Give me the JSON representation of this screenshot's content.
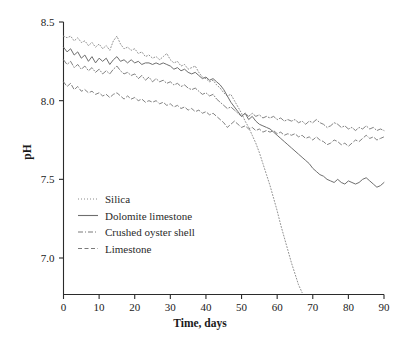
{
  "chart_data": {
    "type": "line",
    "title": "",
    "xlabel": "Time, days",
    "ylabel": "pH",
    "xlim": [
      0,
      90
    ],
    "ylim": [
      6.75,
      8.5
    ],
    "xticks": [
      0,
      10,
      20,
      30,
      40,
      50,
      60,
      70,
      80,
      90
    ],
    "yticks": [
      7.0,
      7.5,
      8.0,
      8.5
    ],
    "xticklabels": [
      "0",
      "10",
      "20",
      "30",
      "40",
      "50",
      "60",
      "70",
      "80",
      "90"
    ],
    "yticklabels": [
      "7.0",
      "7.5",
      "8.0",
      "8.5"
    ],
    "grid": false,
    "legend_position": "lower-left-inside",
    "series": [
      {
        "name": "Silica",
        "style": "dotted",
        "color": "#8a8a8a",
        "x": [
          0,
          1,
          2,
          3,
          4,
          5,
          6,
          7,
          8,
          9,
          10,
          11,
          12,
          13,
          14,
          15,
          16,
          17,
          18,
          19,
          20,
          21,
          22,
          23,
          24,
          25,
          26,
          27,
          28,
          29,
          30,
          31,
          32,
          33,
          34,
          35,
          36,
          37,
          38,
          39,
          40,
          41,
          42,
          43,
          44,
          45,
          46,
          47,
          48,
          49,
          50,
          51,
          52,
          53,
          54,
          55,
          56,
          57,
          58,
          59,
          60,
          61,
          62,
          63,
          64,
          65,
          66,
          67
        ],
        "y": [
          8.41,
          8.4,
          8.41,
          8.38,
          8.4,
          8.37,
          8.38,
          8.35,
          8.37,
          8.34,
          8.36,
          8.33,
          8.35,
          8.32,
          8.38,
          8.41,
          8.36,
          8.33,
          8.34,
          8.32,
          8.33,
          8.3,
          8.31,
          8.28,
          8.29,
          8.27,
          8.28,
          8.26,
          8.28,
          8.3,
          8.26,
          8.24,
          8.25,
          8.22,
          8.23,
          8.2,
          8.21,
          8.22,
          8.18,
          8.15,
          8.14,
          8.12,
          8.13,
          8.1,
          8.08,
          8.05,
          8.03,
          8.04,
          8.0,
          7.96,
          7.92,
          7.87,
          7.83,
          7.78,
          7.73,
          7.67,
          7.6,
          7.53,
          7.46,
          7.38,
          7.3,
          7.21,
          7.13,
          7.05,
          6.97,
          6.9,
          6.83,
          6.78
        ]
      },
      {
        "name": "Dolomite limestone",
        "style": "solid",
        "color": "#6e6e6e",
        "x": [
          0,
          1,
          2,
          3,
          4,
          5,
          6,
          7,
          8,
          9,
          10,
          11,
          12,
          13,
          14,
          15,
          16,
          17,
          18,
          19,
          20,
          21,
          22,
          23,
          24,
          25,
          26,
          27,
          28,
          29,
          30,
          31,
          32,
          33,
          34,
          35,
          36,
          37,
          38,
          39,
          40,
          41,
          42,
          43,
          44,
          45,
          46,
          47,
          48,
          49,
          50,
          51,
          52,
          53,
          54,
          55,
          56,
          57,
          58,
          59,
          60,
          61,
          62,
          63,
          64,
          65,
          66,
          67,
          68,
          69,
          70,
          71,
          72,
          73,
          74,
          75,
          76,
          77,
          78,
          79,
          80,
          81,
          82,
          83,
          84,
          85,
          86,
          87,
          88,
          89,
          90
        ],
        "y": [
          8.34,
          8.31,
          8.33,
          8.29,
          8.31,
          8.27,
          8.29,
          8.25,
          8.28,
          8.24,
          8.27,
          8.25,
          8.27,
          8.23,
          8.26,
          8.28,
          8.25,
          8.26,
          8.24,
          8.26,
          8.24,
          8.25,
          8.23,
          8.24,
          8.24,
          8.23,
          8.24,
          8.23,
          8.24,
          8.23,
          8.22,
          8.2,
          8.21,
          8.19,
          8.2,
          8.18,
          8.17,
          8.18,
          8.16,
          8.14,
          8.15,
          8.13,
          8.14,
          8.12,
          8.1,
          8.07,
          8.03,
          7.99,
          7.96,
          7.93,
          7.9,
          7.92,
          7.88,
          7.9,
          7.87,
          7.85,
          7.84,
          7.83,
          7.82,
          7.8,
          7.78,
          7.76,
          7.74,
          7.72,
          7.7,
          7.68,
          7.66,
          7.64,
          7.62,
          7.6,
          7.57,
          7.55,
          7.53,
          7.52,
          7.5,
          7.49,
          7.48,
          7.5,
          7.48,
          7.47,
          7.49,
          7.48,
          7.47,
          7.48,
          7.5,
          7.51,
          7.49,
          7.47,
          7.45,
          7.46,
          7.48
        ]
      },
      {
        "name": "Crushed oyster shell",
        "style": "dashdot",
        "color": "#7a7a7a",
        "x": [
          0,
          1,
          2,
          3,
          4,
          5,
          6,
          7,
          8,
          9,
          10,
          11,
          12,
          13,
          14,
          15,
          16,
          17,
          18,
          19,
          20,
          21,
          22,
          23,
          24,
          25,
          26,
          27,
          28,
          29,
          30,
          31,
          32,
          33,
          34,
          35,
          36,
          37,
          38,
          39,
          40,
          41,
          42,
          43,
          44,
          45,
          46,
          47,
          48,
          49,
          50,
          51,
          52,
          53,
          54,
          55,
          56,
          57,
          58,
          59,
          60,
          61,
          62,
          63,
          64,
          65,
          66,
          67,
          68,
          69,
          70,
          71,
          72,
          73,
          74,
          75,
          76,
          77,
          78,
          79,
          80,
          81,
          82,
          83,
          84,
          85,
          86,
          87,
          88,
          89,
          90
        ],
        "y": [
          8.26,
          8.23,
          8.25,
          8.21,
          8.23,
          8.2,
          8.22,
          8.19,
          8.21,
          8.18,
          8.2,
          8.17,
          8.19,
          8.17,
          8.2,
          8.22,
          8.19,
          8.17,
          8.18,
          8.16,
          8.17,
          8.14,
          8.16,
          8.13,
          8.15,
          8.12,
          8.14,
          8.12,
          8.13,
          8.11,
          8.12,
          8.1,
          8.11,
          8.09,
          8.1,
          8.08,
          8.07,
          8.08,
          8.06,
          8.04,
          8.05,
          8.03,
          8.04,
          8.01,
          7.99,
          7.97,
          7.95,
          7.96,
          7.94,
          7.92,
          7.9,
          7.92,
          7.9,
          7.92,
          7.9,
          7.91,
          7.89,
          7.9,
          7.89,
          7.9,
          7.88,
          7.89,
          7.87,
          7.88,
          7.87,
          7.88,
          7.86,
          7.87,
          7.85,
          7.87,
          7.86,
          7.88,
          7.86,
          7.85,
          7.83,
          7.84,
          7.86,
          7.85,
          7.83,
          7.84,
          7.82,
          7.83,
          7.81,
          7.83,
          7.82,
          7.84,
          7.82,
          7.83,
          7.81,
          7.82,
          7.81
        ]
      },
      {
        "name": "Limestone",
        "style": "dashed",
        "color": "#7a7a7a",
        "x": [
          0,
          1,
          2,
          3,
          4,
          5,
          6,
          7,
          8,
          9,
          10,
          11,
          12,
          13,
          14,
          15,
          16,
          17,
          18,
          19,
          20,
          21,
          22,
          23,
          24,
          25,
          26,
          27,
          28,
          29,
          30,
          31,
          32,
          33,
          34,
          35,
          36,
          37,
          38,
          39,
          40,
          41,
          42,
          43,
          44,
          45,
          46,
          47,
          48,
          49,
          50,
          51,
          52,
          53,
          54,
          55,
          56,
          57,
          58,
          59,
          60,
          61,
          62,
          63,
          64,
          65,
          66,
          67,
          68,
          69,
          70,
          71,
          72,
          73,
          74,
          75,
          76,
          77,
          78,
          79,
          80,
          81,
          82,
          83,
          84,
          85,
          86,
          87,
          88,
          89,
          90
        ],
        "y": [
          8.12,
          8.09,
          8.11,
          8.07,
          8.09,
          8.06,
          8.07,
          8.05,
          8.06,
          8.04,
          8.05,
          8.03,
          8.04,
          8.02,
          8.04,
          8.05,
          8.03,
          8.01,
          8.03,
          8.01,
          8.02,
          8.0,
          8.01,
          7.99,
          8.0,
          7.99,
          8.0,
          7.98,
          7.99,
          7.97,
          7.98,
          7.96,
          7.97,
          7.95,
          7.96,
          7.94,
          7.95,
          7.93,
          7.94,
          7.92,
          7.93,
          7.91,
          7.92,
          7.9,
          7.88,
          7.86,
          7.83,
          7.85,
          7.87,
          7.85,
          7.83,
          7.84,
          7.82,
          7.83,
          7.81,
          7.82,
          7.8,
          7.81,
          7.8,
          7.81,
          7.79,
          7.8,
          7.78,
          7.79,
          7.78,
          7.79,
          7.77,
          7.78,
          7.76,
          7.77,
          7.75,
          7.77,
          7.75,
          7.74,
          7.72,
          7.73,
          7.75,
          7.74,
          7.72,
          7.73,
          7.71,
          7.73,
          7.75,
          7.74,
          7.76,
          7.78,
          7.76,
          7.77,
          7.75,
          7.76,
          7.77
        ]
      }
    ],
    "legend": [
      {
        "label": "Silica",
        "style": "dotted"
      },
      {
        "label": "Dolomite limestone",
        "style": "solid"
      },
      {
        "label": "Crushed oyster shell",
        "style": "dashdot"
      },
      {
        "label": "Limestone",
        "style": "dashed"
      }
    ]
  },
  "colors": {
    "axis": "#2b2b2b",
    "background": "#ffffff",
    "text": "#1a1a1a"
  }
}
